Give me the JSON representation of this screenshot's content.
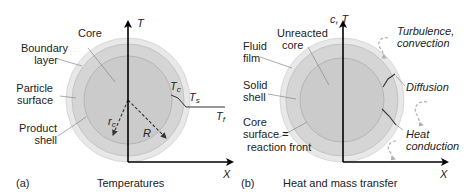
{
  "panel_a": {
    "tag": "(a)",
    "caption": "Temperatures",
    "axis_y_label": "T",
    "axis_x_label": "X",
    "labels": {
      "core": "Core",
      "boundary_layer_1": "Boundary",
      "boundary_layer_2": "layer",
      "particle_surface_1": "Particle",
      "particle_surface_2": "surface",
      "product_shell_1": "Product",
      "product_shell_2": "shell"
    },
    "radius_core_main": "r",
    "radius_core_sub": "c",
    "radius_particle": "R",
    "temp_core_main": "T",
    "temp_core_sub": "c",
    "temp_surface_main": "T",
    "temp_surface_sub": "s",
    "temp_fluid_main": "T",
    "temp_fluid_sub": "f"
  },
  "panel_b": {
    "tag": "(b)",
    "caption": "Heat and mass transfer",
    "axis_y_label": "c, T",
    "axis_x_label": "X",
    "labels": {
      "unreacted_core_1": "Unreacted",
      "unreacted_core_2": "core",
      "fluid_film_1": "Fluid",
      "fluid_film_2": "film",
      "solid_shell_1": "Solid",
      "solid_shell_2": "shell",
      "core_surface_1": "Core",
      "core_surface_2": "surface =",
      "core_surface_3": "reaction front",
      "turbulence_1": "Turbulence,",
      "turbulence_2": "convection",
      "diffusion": "Diffusion",
      "heat_1": "Heat",
      "heat_2": "conduction"
    }
  },
  "colors": {
    "boundary_layer": "#e6e6e6",
    "shell": "#d4d4d4",
    "core": "#c8c8c8",
    "axis": "#000000",
    "leader": "#888888",
    "swirl": "#b0b0b0"
  }
}
